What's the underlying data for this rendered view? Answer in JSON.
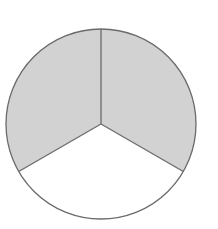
{
  "figure": {
    "name": "circle-divided-into-three-equal-sectors",
    "background_color": "#ffffff",
    "stroke_color": "#6b6b6b",
    "stroke_width": 1.3,
    "shaded_color": "#d2d2d2",
    "unshaded_color": "#ffffff",
    "circle": {
      "center_x": 101,
      "center_y": 124,
      "radius": 95
    },
    "sector_count": 3,
    "sector_angle_degrees": 120,
    "shaded_count": 2,
    "unshaded_count": 1,
    "shaded_fraction": "2/3"
  },
  "chart_data": {
    "type": "pie",
    "title": "",
    "categories": [
      "Shaded sector A",
      "Shaded sector B",
      "Unshaded sector"
    ],
    "values": [
      120,
      120,
      120
    ],
    "value_unit": "degrees",
    "fractions": [
      "1/3",
      "1/3",
      "1/3"
    ],
    "colors": [
      "#d2d2d2",
      "#d2d2d2",
      "#ffffff"
    ],
    "start_angle_degrees": -90,
    "direction": "clockwise",
    "legend": "none",
    "grid": false,
    "labels_shown": false
  },
  "sectors": [
    {
      "id": "sector-top-right",
      "label": "Top-right shaded sector",
      "fill": "#d2d2d2",
      "start_angle_degrees": -90,
      "end_angle_degrees": 30,
      "fraction": "1/3"
    },
    {
      "id": "sector-bottom",
      "label": "Bottom unshaded sector",
      "fill": "#ffffff",
      "start_angle_degrees": 30,
      "end_angle_degrees": 150,
      "fraction": "1/3"
    },
    {
      "id": "sector-top-left",
      "label": "Top-left shaded sector",
      "fill": "#d2d2d2",
      "start_angle_degrees": 150,
      "end_angle_degrees": 270,
      "fraction": "1/3"
    }
  ]
}
